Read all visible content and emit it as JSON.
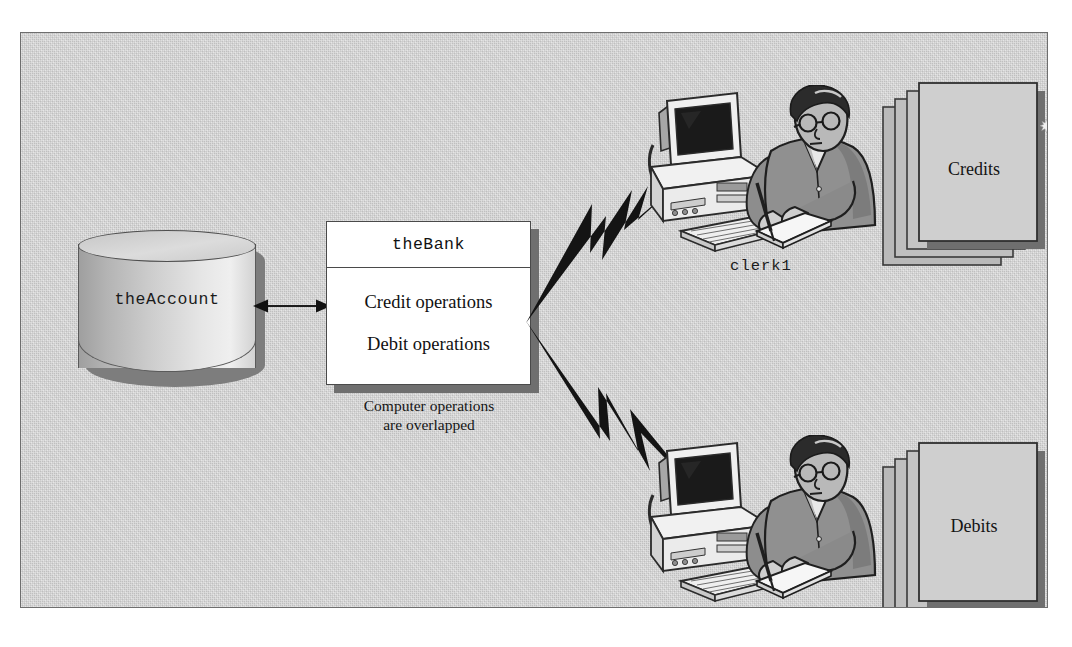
{
  "figure": {
    "background_color": "#c9c9c9",
    "frame_border_color": "#6e6e6e",
    "nodes": {
      "account": {
        "label": "theAccount",
        "shape": "cylinder",
        "font": "monospace"
      },
      "bank": {
        "title": "theBank",
        "operations": [
          "Credit operations",
          "Debit operations"
        ],
        "caption_line1": "Computer operations",
        "caption_line2": "are overlapped"
      }
    },
    "connectors": [
      {
        "name": "account-bank-arrow",
        "type": "double-headed-arrow",
        "from": "theAccount",
        "to": "theBank"
      },
      {
        "name": "bolt-upper",
        "type": "lightning-bolt",
        "from": "theBank",
        "to": "clerk1"
      },
      {
        "name": "bolt-lower",
        "type": "lightning-bolt",
        "from": "theBank",
        "to": "clerk2"
      }
    ],
    "clerks": [
      {
        "label": "clerk1",
        "documents": "Credits"
      },
      {
        "label": "clerk2",
        "documents": "Debits"
      }
    ],
    "documents": [
      {
        "label": "Credits",
        "sheets": 4
      },
      {
        "label": "Debits",
        "sheets": 4
      }
    ]
  },
  "icons": {
    "computer": "desktop-computer-icon",
    "clerk": "clerk-person-icon",
    "documents": "document-stack-icon",
    "bolt": "lightning-bolt-icon",
    "cylinder": "database-cylinder-icon",
    "arrow": "double-arrow-icon",
    "speck": "speck-artifact-icon"
  }
}
